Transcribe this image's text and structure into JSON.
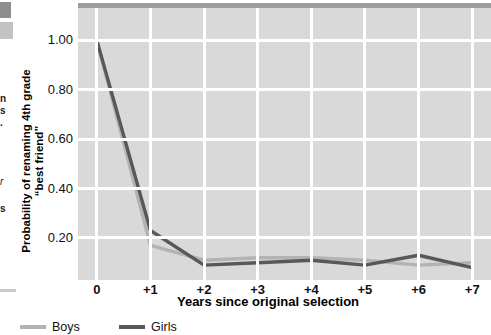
{
  "chart_data": {
    "type": "line",
    "title": "",
    "xlabel": "Years since original selection",
    "ylabel": "Probability of renaming 4th grade “best friend”",
    "categories": [
      "0",
      "+1",
      "+2",
      "+3",
      "+4",
      "+5",
      "+6",
      "+7"
    ],
    "x": [
      0,
      1,
      2,
      3,
      4,
      5,
      6,
      7
    ],
    "xlim": [
      -0.35,
      7.35
    ],
    "ylim": [
      0.03,
      1.13
    ],
    "yticks": [
      0.2,
      0.4,
      0.6,
      0.8,
      1.0
    ],
    "ytick_labels": [
      "0.20",
      "0.40",
      "0.60",
      "0.80",
      "1.00"
    ],
    "grid": true,
    "grid_color": "#ffffff",
    "plot_background": "#d9d9d9",
    "legend_position": "below-left",
    "series": [
      {
        "name": "Boys",
        "color": "#b3b3b3",
        "values": [
          1.0,
          0.17,
          0.11,
          0.12,
          0.12,
          0.11,
          0.09,
          0.1
        ]
      },
      {
        "name": "Girls",
        "color": "#585858",
        "values": [
          1.0,
          0.23,
          0.09,
          0.1,
          0.11,
          0.09,
          0.13,
          0.08
        ]
      }
    ]
  },
  "axes": {
    "y_tick_labels": [
      "1.00",
      "0.80",
      "0.60",
      "0.40",
      "0.20"
    ],
    "x_tick_labels": [
      "0",
      "+1",
      "+2",
      "+3",
      "+4",
      "+5",
      "+6",
      "+7"
    ],
    "y_axis_title": "Probability of renaming 4th grade “best friend”",
    "x_axis_title": "Years since original selection"
  },
  "legend": {
    "items": [
      {
        "label": "Boys",
        "color": "#b3b3b3"
      },
      {
        "label": "Girls",
        "color": "#585858"
      }
    ]
  },
  "margin_artifacts": {
    "fragments": [
      "n",
      "s",
      ".",
      "r",
      "s"
    ]
  }
}
